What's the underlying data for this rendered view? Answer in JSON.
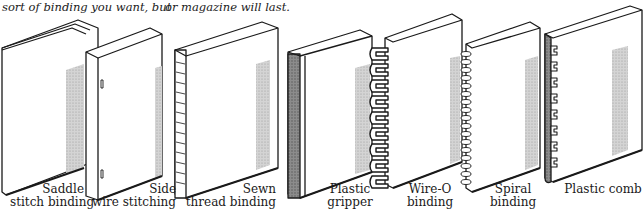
{
  "caption": {
    "left": "sort of binding you want, but",
    "right": "or magazine will last."
  },
  "bindings": [
    {
      "id": "saddle-stitch",
      "line1": "Saddle",
      "line2": "stitch binding"
    },
    {
      "id": "side-wire",
      "line1": "Side",
      "line2": "wire stitching"
    },
    {
      "id": "sewn-thread",
      "line1": "Sewn",
      "line2": "thread binding"
    },
    {
      "id": "plastic-gripper",
      "line1": "Plastic",
      "line2": "gripper"
    },
    {
      "id": "wire-o",
      "line1": "Wire-O",
      "line2": "binding"
    },
    {
      "id": "spiral",
      "line1": "Spiral",
      "line2": "binding"
    },
    {
      "id": "plastic-comb",
      "line1": "Plastic comb",
      "line2": ""
    }
  ],
  "colors": {
    "ink": "#1a1a1a",
    "shade": "#bdbdbd",
    "paper": "#ffffff"
  }
}
